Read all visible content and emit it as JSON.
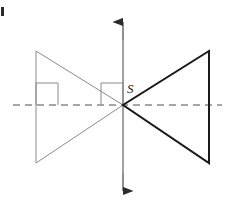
{
  "figure": {
    "width": 231,
    "height": 213,
    "background_color": "#ffffff"
  },
  "labels": {
    "center_point": "S"
  },
  "colors": {
    "preimage_stroke": "#8a8a8a",
    "image_stroke": "#1a1a1a",
    "axis_vertical": "#8a8a8a",
    "axis_horizontal_dashed": "#8a8a8a",
    "right_angle_marker": "#8a8a8a",
    "corner_mark": "#2b2b2b"
  },
  "geometry": {
    "center": {
      "x": 123,
      "y": 105
    },
    "preimage_triangle": {
      "name": "left-triangle",
      "vertices": [
        {
          "x": 36,
          "y": 51
        },
        {
          "x": 36,
          "y": 163
        },
        {
          "x": 123,
          "y": 105
        }
      ],
      "stroke_width": 1
    },
    "image_triangle": {
      "name": "right-triangle",
      "vertices": [
        {
          "x": 209,
          "y": 51
        },
        {
          "x": 209,
          "y": 163
        },
        {
          "x": 123,
          "y": 105
        }
      ],
      "stroke_width": 2
    },
    "vertical_axis": {
      "x": 123,
      "y_top": 12,
      "y_bottom": 201,
      "arrow_top": true,
      "arrow_bottom": true
    },
    "horizontal_axis": {
      "y": 105,
      "x_left": 13,
      "x_right": 222,
      "dash_pattern": "7 5"
    },
    "right_angle_markers": [
      {
        "name": "left-square",
        "x": 36,
        "y": 83,
        "size": 22
      },
      {
        "name": "center-square",
        "x": 101,
        "y": 83,
        "size": 22
      }
    ],
    "corner_mark": {
      "x": 1,
      "y": 7,
      "width": 3,
      "height": 9
    }
  }
}
